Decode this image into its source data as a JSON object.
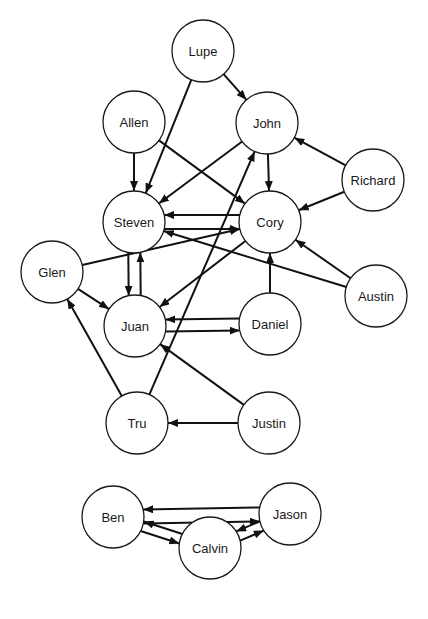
{
  "diagram": {
    "type": "directed-graph",
    "node_radius": 31,
    "colors": {
      "stroke": "#1a1a1a",
      "fill": "#ffffff",
      "edge": "#111111"
    },
    "nodes": [
      {
        "id": "Lupe",
        "label": "Lupe",
        "x": 203,
        "y": 51
      },
      {
        "id": "Allen",
        "label": "Allen",
        "x": 134,
        "y": 122
      },
      {
        "id": "John",
        "label": "John",
        "x": 267,
        "y": 123
      },
      {
        "id": "Richard",
        "label": "Richard",
        "x": 373,
        "y": 180
      },
      {
        "id": "Steven",
        "label": "Steven",
        "x": 134,
        "y": 222
      },
      {
        "id": "Cory",
        "label": "Cory",
        "x": 270,
        "y": 222
      },
      {
        "id": "Glen",
        "label": "Glen",
        "x": 52,
        "y": 272
      },
      {
        "id": "Austin",
        "label": "Austin",
        "x": 376,
        "y": 296
      },
      {
        "id": "Juan",
        "label": "Juan",
        "x": 135,
        "y": 326
      },
      {
        "id": "Daniel",
        "label": "Daniel",
        "x": 270,
        "y": 324
      },
      {
        "id": "Tru",
        "label": "Tru",
        "x": 137,
        "y": 423
      },
      {
        "id": "Justin",
        "label": "Justin",
        "x": 269,
        "y": 423
      },
      {
        "id": "Ben",
        "label": "Ben",
        "x": 113,
        "y": 517
      },
      {
        "id": "Jason",
        "label": "Jason",
        "x": 290,
        "y": 514
      },
      {
        "id": "Calvin",
        "label": "Calvin",
        "x": 210,
        "y": 548
      }
    ],
    "edges": [
      {
        "from": "Lupe",
        "to": "John",
        "offset": 0
      },
      {
        "from": "Lupe",
        "to": "Steven",
        "offset": 0
      },
      {
        "from": "Allen",
        "to": "Steven",
        "offset": 0
      },
      {
        "from": "Allen",
        "to": "Cory",
        "offset": 0
      },
      {
        "from": "John",
        "to": "Steven",
        "offset": 0
      },
      {
        "from": "John",
        "to": "Cory",
        "offset": 0
      },
      {
        "from": "Richard",
        "to": "John",
        "offset": 0
      },
      {
        "from": "Richard",
        "to": "Cory",
        "offset": 0
      },
      {
        "from": "Steven",
        "to": "Cory",
        "offset": 7
      },
      {
        "from": "Cory",
        "to": "Steven",
        "offset": 7
      },
      {
        "from": "Steven",
        "to": "Juan",
        "offset": 6
      },
      {
        "from": "Juan",
        "to": "Steven",
        "offset": 6
      },
      {
        "from": "Glen",
        "to": "Cory",
        "offset": 0
      },
      {
        "from": "Glen",
        "to": "Juan",
        "offset": 0
      },
      {
        "from": "Cory",
        "to": "Juan",
        "offset": 0
      },
      {
        "from": "Austin",
        "to": "Steven",
        "offset": 0
      },
      {
        "from": "Austin",
        "to": "Cory",
        "offset": 0
      },
      {
        "from": "Daniel",
        "to": "Cory",
        "offset": 0
      },
      {
        "from": "Juan",
        "to": "Daniel",
        "offset": 6
      },
      {
        "from": "Daniel",
        "to": "Juan",
        "offset": 6
      },
      {
        "from": "Tru",
        "to": "Glen",
        "offset": 0
      },
      {
        "from": "Tru",
        "to": "John",
        "offset": 0
      },
      {
        "from": "Justin",
        "to": "Tru",
        "offset": 0
      },
      {
        "from": "Justin",
        "to": "Juan",
        "offset": 0
      },
      {
        "from": "Ben",
        "to": "Jason",
        "offset": 7
      },
      {
        "from": "Jason",
        "to": "Ben",
        "offset": 7
      },
      {
        "from": "Ben",
        "to": "Calvin",
        "offset": 5
      },
      {
        "from": "Calvin",
        "to": "Ben",
        "offset": 5
      },
      {
        "from": "Calvin",
        "to": "Jason",
        "offset": 5
      },
      {
        "from": "Jason",
        "to": "Calvin",
        "offset": 5
      }
    ]
  }
}
